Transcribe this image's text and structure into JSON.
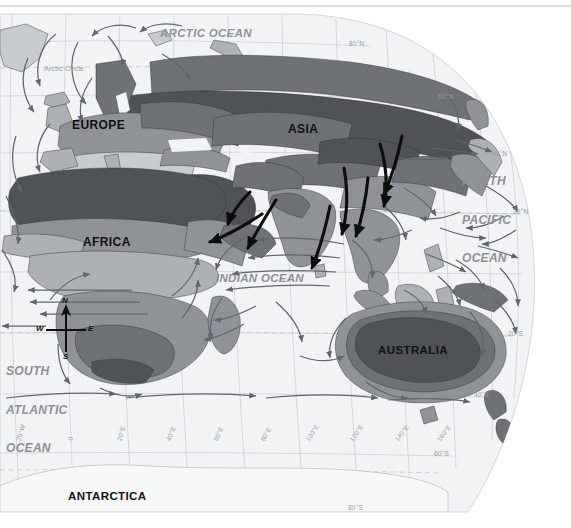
{
  "map": {
    "title_type": "world-climate-monsoon-map",
    "projection": "curved globe edge, right side",
    "background_color": "#ffffff",
    "ocean_color": "#f2f3f4",
    "graticule_color": "#c9ccd1",
    "current_arrow_color": "#5f666d",
    "monsoon_arrow_color": "#0d0d0d",
    "climate_colors": {
      "very_dark": "#4f5357",
      "dark": "#6e7276",
      "medium": "#8f9398",
      "light": "#adb1b5",
      "very_light": "#c9cccf",
      "palest": "#e2e4e6"
    }
  },
  "continents": [
    {
      "name": "EUROPE",
      "x": 72,
      "y": 118
    },
    {
      "name": "ASIA",
      "x": 288,
      "y": 122
    },
    {
      "name": "AFRICA",
      "x": 83,
      "y": 235
    },
    {
      "name": "AUSTRALIA",
      "x": 378,
      "y": 344
    },
    {
      "name": "ANTARCTICA",
      "x": 68,
      "y": 492
    }
  ],
  "oceans": [
    {
      "name": "ARCTIC OCEAN",
      "x": 160,
      "y": 28,
      "lines": [
        "ARCTIC OCEAN"
      ]
    },
    {
      "name": "NORTH PACIFIC OCEAN",
      "x": 462,
      "y": 156,
      "lines": [
        "NORTH",
        "PACIFIC",
        "OCEAN"
      ]
    },
    {
      "name": "INDIAN OCEAN",
      "x": 218,
      "y": 278,
      "lines": [
        "INDIAN OCEAN"
      ]
    },
    {
      "name": "SOUTH ATLANTIC OCEAN",
      "x": 8,
      "y": 346,
      "lines": [
        "SOUTH",
        "ATLANTIC",
        "OCEAN"
      ]
    }
  ],
  "special_lines": [
    {
      "label": "Arctic Circle",
      "x": 44,
      "y": 70,
      "style": "dashed"
    }
  ],
  "latitude_labels": [
    {
      "text": "80°N",
      "x": 349,
      "y": 43
    },
    {
      "text": "60°N",
      "x": 438,
      "y": 96
    },
    {
      "text": "40°N",
      "x": 492,
      "y": 153
    },
    {
      "text": "20°N",
      "x": 513,
      "y": 211
    },
    {
      "text": "20°S",
      "x": 508,
      "y": 333
    },
    {
      "text": "40°S",
      "x": 474,
      "y": 394
    },
    {
      "text": "60°S",
      "x": 434,
      "y": 453
    },
    {
      "text": "80°S",
      "x": 348,
      "y": 507
    }
  ],
  "longitude_labels": [
    {
      "text": "20°W",
      "x": 18,
      "y": 437,
      "rot": -72
    },
    {
      "text": "0",
      "x": 70,
      "y": 437,
      "rot": -82
    },
    {
      "text": "20°E",
      "x": 119,
      "y": 437,
      "rot": -74
    },
    {
      "text": "40°E",
      "x": 168,
      "y": 437,
      "rot": -68
    },
    {
      "text": "60°E",
      "x": 215,
      "y": 437,
      "rot": -64
    },
    {
      "text": "80°E",
      "x": 262,
      "y": 437,
      "rot": -60
    },
    {
      "text": "100°E",
      "x": 307,
      "y": 437,
      "rot": -57
    },
    {
      "text": "120°E",
      "x": 351,
      "y": 437,
      "rot": -55
    },
    {
      "text": "140°E",
      "x": 396,
      "y": 437,
      "rot": -53
    },
    {
      "text": "160°E",
      "x": 438,
      "y": 437,
      "rot": -52
    }
  ],
  "compass": {
    "center_x": 66,
    "center_y": 330,
    "north": "N",
    "south": "S",
    "east": "E",
    "west": "W"
  },
  "legend_note": "Thick black arrows indicate monsoon winds; thin grey arrows indicate ocean surface currents."
}
